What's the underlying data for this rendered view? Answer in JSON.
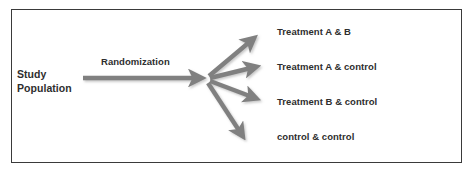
{
  "diagram": {
    "frame": {
      "border_color": "#3a3a3a",
      "background_color": "#ffffff"
    },
    "arrow_color": "#808080",
    "text_color": "#2e2e2e",
    "source": {
      "label": "Study Population"
    },
    "process": {
      "label": "Randomization"
    },
    "outcomes": [
      {
        "label": "Treatment A & B"
      },
      {
        "label": "Treatment A & control"
      },
      {
        "label": "Treatment B & control"
      },
      {
        "label": "control & control"
      }
    ],
    "arrows": [
      {
        "name": "arrow-source-to-randomization",
        "from": [
          83,
          78
        ],
        "to": [
          208,
          78
        ]
      },
      {
        "name": "arrow-to-treatment-a-and-b",
        "from": [
          207,
          77
        ],
        "to": [
          260,
          33
        ]
      },
      {
        "name": "arrow-to-treatment-a-and-control",
        "from": [
          207,
          78
        ],
        "to": [
          262,
          66
        ]
      },
      {
        "name": "arrow-to-treatment-b-and-control",
        "from": [
          207,
          80
        ],
        "to": [
          262,
          100
        ]
      },
      {
        "name": "arrow-to-control-and-control",
        "from": [
          206,
          81
        ],
        "to": [
          248,
          143
        ]
      }
    ]
  }
}
